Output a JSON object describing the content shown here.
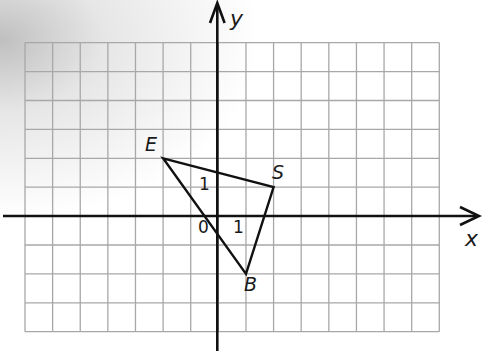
{
  "diagram": {
    "type": "coordinate-plane",
    "grid": {
      "x_min": -7,
      "x_max": 8,
      "y_min": -4,
      "y_max": 6,
      "left_px": 25,
      "top_px": 42.7,
      "right_px": 439.3,
      "bottom_px": 331.7,
      "line_color": "#a8a8a8"
    },
    "axes": {
      "x_label": "x",
      "y_label": "y",
      "origin_label": "0",
      "x_unit_label": "1",
      "y_unit_label": "1",
      "color": "#111111"
    },
    "triangle": {
      "name": "ESB",
      "vertices": [
        {
          "label": "E",
          "x": -2,
          "y": 2
        },
        {
          "label": "S",
          "x": 2,
          "y": 1
        },
        {
          "label": "B",
          "x": 1,
          "y": -2
        }
      ],
      "stroke": "#111111"
    },
    "background": {
      "base": "#ffffff",
      "corner_shade": "#bdbdbd"
    }
  },
  "chart_data": {
    "type": "scatter",
    "title": "",
    "xlabel": "x",
    "ylabel": "y",
    "xlim": [
      -7,
      8
    ],
    "ylim": [
      -4,
      6
    ],
    "grid": true,
    "series": [
      {
        "name": "Triangle ESB",
        "points": [
          {
            "label": "E",
            "x": -2,
            "y": 2
          },
          {
            "label": "S",
            "x": 2,
            "y": 1
          },
          {
            "label": "B",
            "x": 1,
            "y": -2
          }
        ],
        "closed": true
      }
    ],
    "annotations": [
      "0",
      "1 (x-axis unit)",
      "1 (y-axis unit)"
    ]
  }
}
